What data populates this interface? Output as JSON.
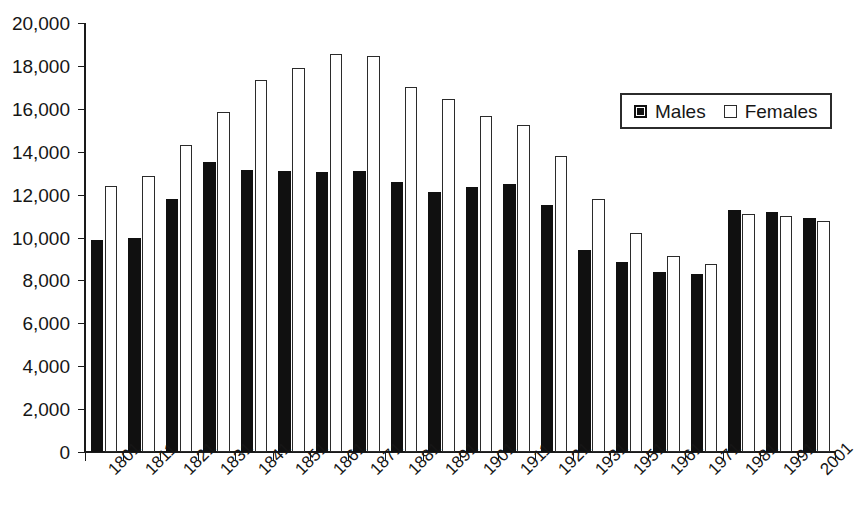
{
  "chart_data": {
    "type": "bar",
    "title": "",
    "subtitle": "",
    "xlabel": "",
    "ylabel": "",
    "ylim": [
      0,
      20000
    ],
    "ytick_step": 2000,
    "grid": false,
    "legend_position": "top-right",
    "categories": [
      "1801",
      "1811",
      "1821",
      "1831",
      "1841",
      "1851",
      "1861",
      "1871",
      "1881",
      "1891",
      "1901",
      "1911",
      "1921",
      "1931",
      "1951",
      "1961",
      "1971",
      "1981",
      "1991",
      "2001"
    ],
    "ytick_labels": [
      "20,000",
      "18,000",
      "16,000",
      "14,000",
      "12,000",
      "10,000",
      "8,000",
      "6,000",
      "4,000",
      "2,000",
      "0"
    ],
    "ytick_values": [
      20000,
      18000,
      16000,
      14000,
      12000,
      10000,
      8000,
      6000,
      4000,
      2000,
      0
    ],
    "series": [
      {
        "name": "Males",
        "color": "#101010",
        "style": "filled",
        "values": [
          9900,
          10000,
          11800,
          13500,
          13150,
          13100,
          13050,
          13100,
          12600,
          12100,
          12350,
          12500,
          11500,
          9400,
          8850,
          8400,
          8300,
          11300,
          11200,
          10900
        ]
      },
      {
        "name": "Females",
        "color": "#ffffff",
        "style": "outlined",
        "values": [
          12400,
          12850,
          14300,
          15850,
          17350,
          17900,
          18550,
          18450,
          17000,
          16450,
          15650,
          15250,
          13800,
          11800,
          10200,
          9150,
          8750,
          11100,
          11000,
          10750
        ]
      }
    ],
    "legend": [
      {
        "label": "Males",
        "swatch": "filled-square-icon"
      },
      {
        "label": "Females",
        "swatch": "outlined-square-icon"
      }
    ]
  }
}
